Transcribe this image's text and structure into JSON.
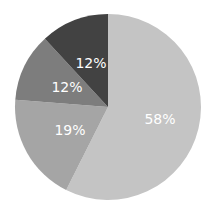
{
  "chart_data": {
    "type": "pie",
    "title": "",
    "start_angle_deg": 0,
    "direction": "clockwise",
    "categories": [
      "Slice A",
      "Slice B",
      "Slice C",
      "Slice D"
    ],
    "values": [
      58,
      19,
      12,
      12
    ],
    "labels": [
      "58%",
      "19%",
      "12%",
      "12%"
    ],
    "colors": [
      "#c4c4c4",
      "#a5a5a5",
      "#7d7d7d",
      "#424242"
    ],
    "legend": "none"
  }
}
